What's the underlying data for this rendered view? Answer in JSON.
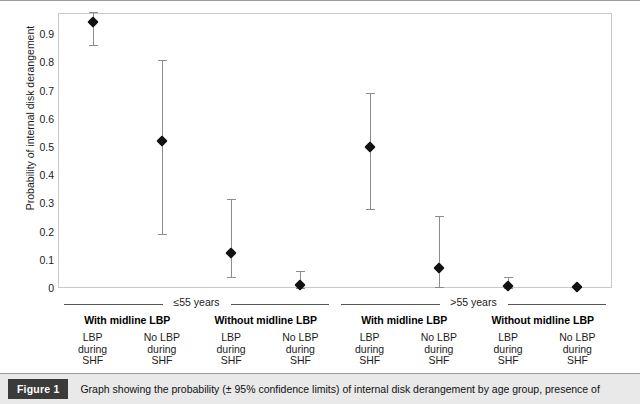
{
  "figure": {
    "tag": "Figure 1",
    "caption": "Graph showing the probability (± 95% confidence limits) of internal disk derangement by age group, presence of"
  },
  "chart_data": {
    "type": "scatter",
    "title": "",
    "xlabel": "",
    "ylabel": "Probability of internal disk derangement",
    "ylim": [
      0,
      1.0
    ],
    "ytick_labels": [
      "0.9",
      "0.8",
      "0.7",
      "0.6",
      "0.5",
      "0.4",
      "0.3",
      "0.2",
      "0.1",
      "0"
    ],
    "ytick_values": [
      0.9,
      0.8,
      0.7,
      0.6,
      0.5,
      0.4,
      0.3,
      0.2,
      0.1,
      0
    ],
    "grid": false,
    "legend": "none",
    "error_bars": "95% confidence limits",
    "age_groups": [
      {
        "label": "≤55 years"
      },
      {
        "label": ">55 years"
      }
    ],
    "midline_groups": [
      "With midline LBP",
      "Without midline LBP",
      "With midline LBP",
      "Without midline LBP"
    ],
    "categories": [
      "LBP\nduring\nSHF",
      "No LBP\nduring\nSHF",
      "LBP\nduring\nSHF",
      "No LBP\nduring\nSHF",
      "LBP\nduring\nSHF",
      "No LBP\nduring\nSHF",
      "LBP\nduring\nSHF",
      "No LBP\nduring\nSHF"
    ],
    "category_lines": [
      [
        "LBP",
        "during",
        "SHF"
      ],
      [
        "No LBP",
        "during",
        "SHF"
      ],
      [
        "LBP",
        "during",
        "SHF"
      ],
      [
        "No LBP",
        "during",
        "SHF"
      ],
      [
        "LBP",
        "during",
        "SHF"
      ],
      [
        "No LBP",
        "during",
        "SHF"
      ],
      [
        "LBP",
        "during",
        "SHF"
      ],
      [
        "No LBP",
        "during",
        "SHF"
      ]
    ],
    "points": [
      {
        "value": 0.945,
        "low": 0.86,
        "high": 0.98
      },
      {
        "value": 0.52,
        "low": 0.19,
        "high": 0.81
      },
      {
        "value": 0.125,
        "low": 0.04,
        "high": 0.315
      },
      {
        "value": 0.01,
        "low": 0.0,
        "high": 0.06
      },
      {
        "value": 0.5,
        "low": 0.28,
        "high": 0.69
      },
      {
        "value": 0.07,
        "low": 0.005,
        "high": 0.255
      },
      {
        "value": 0.008,
        "low": 0.0,
        "high": 0.04
      },
      {
        "value": 0.002,
        "low": 0.002,
        "high": 0.002
      }
    ]
  },
  "colors": {
    "marker": "#111111",
    "error_bar": "#8c8c8c",
    "plot_border": "#c9c9c9",
    "caption_band": "#e9e9e9",
    "caption_tag": "#3b3b3b"
  }
}
